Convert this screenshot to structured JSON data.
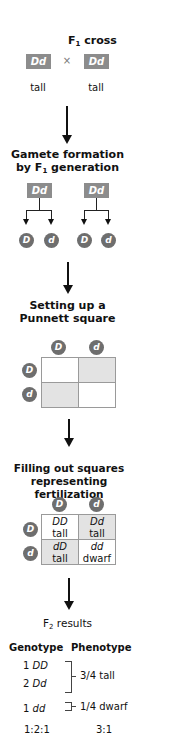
{
  "steps": {
    "f1_cross": {
      "title_main": "F",
      "title_sub": "1",
      "title_rest": " cross",
      "parent_left": "Dd",
      "cross_symbol": "×",
      "parent_right": "Dd",
      "phenotype_left": "tall",
      "phenotype_right": "tall"
    },
    "gamete_formation": {
      "title_line1": "Gamete formation",
      "title_line2_pre": "by F",
      "title_line2_sub": "1",
      "title_line2_post": " generation",
      "parents": [
        "Dd",
        "Dd"
      ],
      "gametes": [
        "D",
        "d",
        "D",
        "d"
      ]
    },
    "punnett_setup": {
      "title_line1": "Setting up a",
      "title_line2": "Punnett square",
      "col_alleles": [
        "D",
        "d"
      ],
      "row_alleles": [
        "D",
        "d"
      ]
    },
    "fertilization": {
      "title_line1": "Filling out squares",
      "title_line2": "representing fertilization",
      "col_alleles": [
        "D",
        "d"
      ],
      "row_alleles": [
        "D",
        "d"
      ],
      "cells": [
        {
          "genotype": "DD",
          "phenotype": "tall"
        },
        {
          "genotype": "Dd",
          "phenotype": "tall"
        },
        {
          "genotype": "dD",
          "phenotype": "tall"
        },
        {
          "genotype": "dd",
          "phenotype": "dwarf"
        }
      ]
    },
    "f2_results": {
      "title_main": "F",
      "title_sub": "2",
      "title_rest": " results",
      "header_genotype": "Genotype",
      "header_phenotype": "Phenotype",
      "genotypes": [
        {
          "count": "1",
          "genotype": "DD"
        },
        {
          "count": "2",
          "genotype": "Dd"
        },
        {
          "count": "1",
          "genotype": "dd"
        }
      ],
      "phenotypes": [
        "3/4 tall",
        "1/4 dwarf"
      ],
      "genotype_ratio": "1:2:1",
      "phenotype_ratio": "3:1"
    }
  },
  "colors": {
    "box_gray": "#8c8c8c",
    "circle_gray": "#6e6e6e",
    "shade_gray": "#e3e3e3",
    "grid_border": "#9a9a9a"
  }
}
